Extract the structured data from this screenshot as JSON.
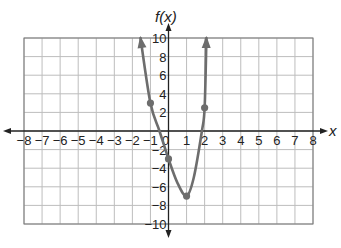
{
  "chart_data": {
    "type": "line",
    "title": "",
    "xlabel": "x",
    "ylabel": "f(x)",
    "xlim": [
      -8,
      8
    ],
    "ylim": [
      -10,
      10
    ],
    "grid": true,
    "x_ticks": [
      "−8",
      "−7",
      "−6",
      "−5",
      "−4",
      "−3",
      "−2",
      "−1",
      "0",
      "1",
      "2",
      "3",
      "4",
      "5",
      "6",
      "7",
      "8"
    ],
    "y_ticks": [
      "10",
      "8",
      "6",
      "4",
      "2",
      "−2",
      "−4",
      "−6",
      "−8",
      "−10"
    ],
    "series": [
      {
        "name": "f(x)",
        "color": "#6d6d6d",
        "marked_points": [
          {
            "x": -1,
            "y": 3
          },
          {
            "x": 0,
            "y": -3
          },
          {
            "x": 1,
            "y": -7
          },
          {
            "x": 2,
            "y": 2.5
          }
        ],
        "curve_points": [
          {
            "x": -1.55,
            "y": 10
          },
          {
            "x": -1,
            "y": 3
          },
          {
            "x": -0.5,
            "y": 0
          },
          {
            "x": 0,
            "y": -3
          },
          {
            "x": 0.5,
            "y": -5.6
          },
          {
            "x": 1,
            "y": -7
          },
          {
            "x": 1.4,
            "y": -5
          },
          {
            "x": 1.85,
            "y": 0
          },
          {
            "x": 2,
            "y": 2.5
          },
          {
            "x": 2.1,
            "y": 10
          }
        ],
        "end_arrows": true
      }
    ]
  }
}
